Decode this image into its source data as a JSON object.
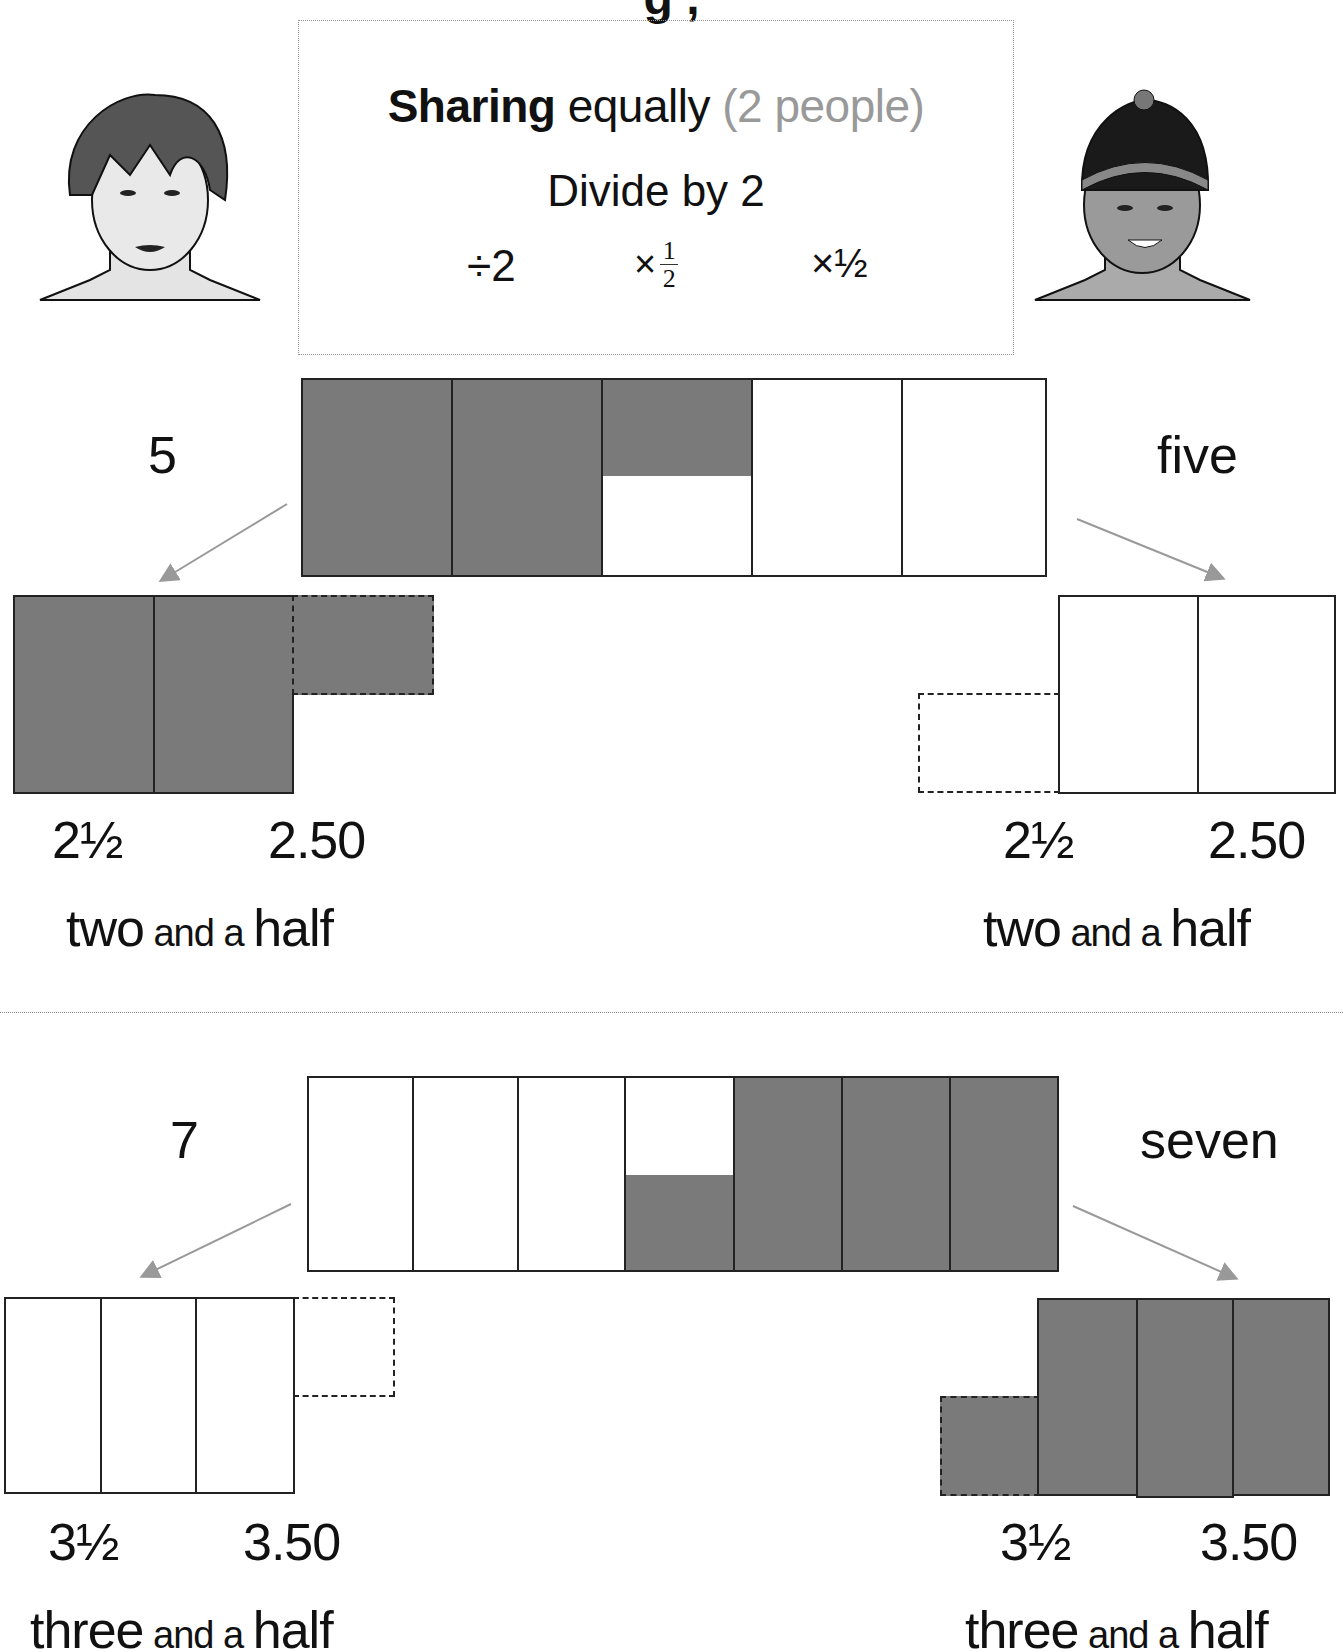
{
  "title_fragment": "g ,",
  "info_box": {
    "bold_word": "Sharing",
    "plain_word": " equally ",
    "muted_part": "(2 people)",
    "line2": "Divide by 2",
    "op_divide": "÷2",
    "op_times": "×",
    "frac_num": "1",
    "frac_den": "2",
    "op_times_half": "×½"
  },
  "characters": {
    "left": "girl-face-icon",
    "right": "boy-with-cap-face-icon"
  },
  "colors": {
    "shaded": "#7a7a7a",
    "arrow": "#999999",
    "muted_text": "#999999"
  },
  "section1": {
    "number": "5",
    "word": "five",
    "whole_cells": 5,
    "left_share": {
      "fraction": "2½",
      "decimal": "2.50",
      "words_a": "two",
      "words_b": " and a ",
      "words_c": "half"
    },
    "right_share": {
      "fraction": "2½",
      "decimal": "2.50",
      "words_a": "two",
      "words_b": " and a ",
      "words_c": "half"
    }
  },
  "section2": {
    "number": "7",
    "word": "seven",
    "whole_cells": 7,
    "left_share": {
      "fraction": "3½",
      "decimal": "3.50",
      "words_a": "three",
      "words_b": " and a ",
      "words_c": "half"
    },
    "right_share": {
      "fraction": "3½",
      "decimal": "3.50",
      "words_a": "three",
      "words_b": " and a ",
      "words_c": "half"
    }
  }
}
